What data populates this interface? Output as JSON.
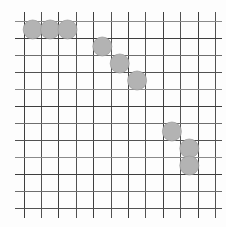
{
  "board": {
    "grid": {
      "columns": 11,
      "rows": 11,
      "vertical_line_count": 12,
      "horizontal_line_count": 12,
      "line_shades": [
        "#6e6e6e",
        "#3e3e3e",
        "#8a8a8a",
        "#525252"
      ],
      "background_color": "#fdfdfd"
    },
    "stones": [
      {
        "col": 1,
        "row": 1
      },
      {
        "col": 2,
        "row": 1
      },
      {
        "col": 3,
        "row": 1
      },
      {
        "col": 5,
        "row": 2
      },
      {
        "col": 6,
        "row": 3
      },
      {
        "col": 7,
        "row": 4
      },
      {
        "col": 9,
        "row": 7
      },
      {
        "col": 10,
        "row": 8
      },
      {
        "col": 10,
        "row": 9
      }
    ],
    "stone_fill_color": "#b3b3b3",
    "stone_edge_color": "#9c9c9c"
  }
}
